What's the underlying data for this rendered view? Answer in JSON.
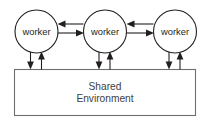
{
  "diagram": {
    "type": "node-edge-diagram",
    "canvas": {
      "width": 210,
      "height": 124,
      "background": "#ffffff"
    },
    "colors": {
      "node_stroke": "#231f20",
      "node_fill": "#ffffff",
      "box_stroke": "#6f6f6f",
      "box_fill": "#ffffff",
      "arrow": "#231f20",
      "node_text": "#231f20",
      "box_text": "#404040"
    },
    "nodes": [
      {
        "id": "worker-left",
        "label": "worker",
        "shape": "circle",
        "cx": 36.5,
        "cy": 31.5,
        "r": 21.5
      },
      {
        "id": "worker-middle",
        "label": "worker",
        "shape": "circle",
        "cx": 105.0,
        "cy": 31.5,
        "r": 21.5
      },
      {
        "id": "worker-right",
        "label": "worker",
        "shape": "circle",
        "cx": 175.0,
        "cy": 31.5,
        "r": 21.5
      }
    ],
    "container": {
      "id": "shared-environment",
      "shape": "rectangle",
      "label_line1": "Shared",
      "label_line2": "Environment",
      "x": 14,
      "y": 69,
      "width": 182,
      "height": 47
    },
    "edges": [
      {
        "id": "mid-to-left",
        "from": "worker-middle",
        "to": "worker-left",
        "orientation": "horizontal",
        "direction": "left",
        "y": 24
      },
      {
        "id": "left-to-mid",
        "from": "worker-left",
        "to": "worker-middle",
        "orientation": "horizontal",
        "direction": "right",
        "y": 33
      },
      {
        "id": "right-to-mid",
        "from": "worker-right",
        "to": "worker-middle",
        "orientation": "horizontal",
        "direction": "left",
        "y": 24
      },
      {
        "id": "mid-to-right",
        "from": "worker-middle",
        "to": "worker-right",
        "orientation": "horizontal",
        "direction": "right",
        "y": 33
      },
      {
        "id": "left-to-env",
        "from": "worker-left",
        "to": "shared-environment",
        "orientation": "vertical",
        "direction": "down",
        "x": 30.5
      },
      {
        "id": "env-to-left",
        "from": "shared-environment",
        "to": "worker-left",
        "orientation": "vertical",
        "direction": "up",
        "x": 41.5
      },
      {
        "id": "mid-to-env",
        "from": "worker-middle",
        "to": "shared-environment",
        "orientation": "vertical",
        "direction": "down",
        "x": 99.0
      },
      {
        "id": "env-to-mid",
        "from": "shared-environment",
        "to": "worker-middle",
        "orientation": "vertical",
        "direction": "up",
        "x": 110.0
      },
      {
        "id": "right-to-env",
        "from": "worker-right",
        "to": "shared-environment",
        "orientation": "vertical",
        "direction": "down",
        "x": 169.0
      },
      {
        "id": "env-to-right",
        "from": "shared-environment",
        "to": "worker-right",
        "orientation": "vertical",
        "direction": "up",
        "x": 180.0
      }
    ]
  }
}
